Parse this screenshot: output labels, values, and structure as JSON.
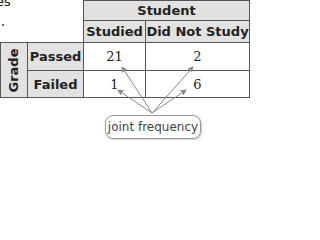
{
  "fragment": {
    "text": "es"
  },
  "table": {
    "column_group_header": "Student",
    "row_group_header": "Grade",
    "columns": [
      "Studied",
      "Did Not Study"
    ],
    "rows": [
      {
        "label": "Passed",
        "values": [
          "21",
          "2"
        ]
      },
      {
        "label": "Failed",
        "values": [
          "1",
          "6"
        ]
      }
    ]
  },
  "callout": {
    "label": "joint frequency"
  },
  "colors": {
    "header_bg": "#e2e2e2",
    "border": "#555555",
    "arrow": "#8a8a8a"
  }
}
